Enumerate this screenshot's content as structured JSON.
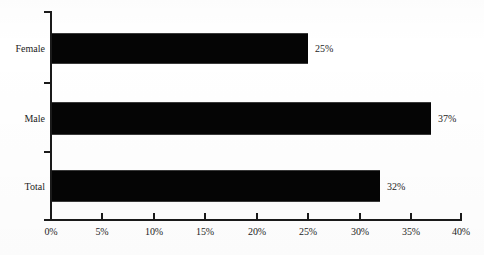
{
  "chart_data": {
    "type": "bar",
    "orientation": "horizontal",
    "title": "",
    "subtitle": "",
    "xlabel": "",
    "ylabel": "",
    "categories": [
      "Female",
      "Male",
      "Total"
    ],
    "values": [
      25,
      37,
      32
    ],
    "data_labels": [
      "25%",
      "37%",
      "32%"
    ],
    "xlim": [
      0,
      40
    ],
    "xtick_values": [
      0,
      5,
      10,
      15,
      20,
      25,
      30,
      35,
      40
    ],
    "xtick_labels": [
      "0%",
      "5%",
      "10%",
      "15%",
      "20%",
      "25%",
      "30%",
      "35%",
      "40%"
    ],
    "grid": false,
    "legend": false,
    "legend_position": "none",
    "bar_color": "#050505",
    "axis_color": "#1a1a1a",
    "background_color": "#ffffff",
    "series": [
      {
        "name": "",
        "values": [
          25,
          37,
          32
        ]
      }
    ]
  }
}
